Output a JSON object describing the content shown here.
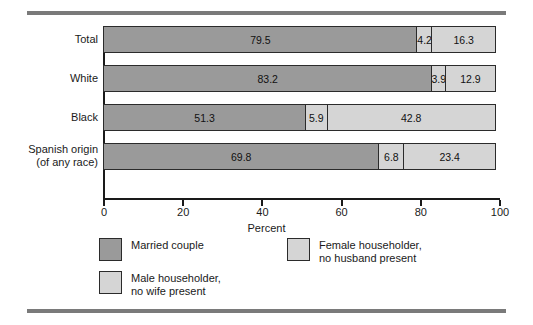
{
  "chart_data": {
    "type": "bar",
    "orientation": "horizontal",
    "stacked": true,
    "title": "",
    "xlabel": "Percent",
    "ylabel": "",
    "xlim": [
      0,
      100
    ],
    "xticks": [
      0,
      20,
      40,
      60,
      80,
      100
    ],
    "xticklabels": [
      "0",
      "20",
      "40",
      "60",
      "80",
      "100"
    ],
    "grid": false,
    "legend_position": "bottom-left",
    "categories": [
      "Total",
      "White",
      "Black",
      "Spanish origin\n(of any race)"
    ],
    "series": [
      {
        "name": "Married couple",
        "color": "#9a9a9a",
        "values": [
          79.5,
          83.2,
          51.3,
          69.8
        ]
      },
      {
        "name": "Male householder,\nno wife present",
        "color": "#d5d5d5",
        "values": [
          4.2,
          3.9,
          5.9,
          6.8
        ]
      },
      {
        "name": "Female householder,\nno husband present",
        "color": "#d5d5d5",
        "values": [
          16.3,
          12.9,
          42.8,
          23.4
        ]
      }
    ],
    "bar_labels": [
      [
        "79.5",
        "4.2",
        "16.3"
      ],
      [
        "83.2",
        "3.9",
        "12.9"
      ],
      [
        "51.3",
        "5.9",
        "42.8"
      ],
      [
        "69.8",
        "6.8",
        "23.4"
      ]
    ]
  },
  "colors": {
    "married": "#9a9a9a",
    "male_householder": "#d5d5d5",
    "female_householder": "#d5d5d5",
    "rule": "#7a7a7a",
    "outline": "#2b2b2b",
    "background": "#ffffff"
  }
}
